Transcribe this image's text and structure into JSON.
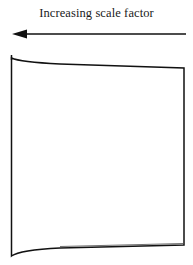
{
  "diagram": {
    "arrow": {
      "label": "Increasing scale factor",
      "direction": "left",
      "color": "#111111"
    },
    "shape": {
      "description": "warped square panel",
      "stroke_color": "#111111",
      "fill_color": "#ffffff"
    }
  }
}
